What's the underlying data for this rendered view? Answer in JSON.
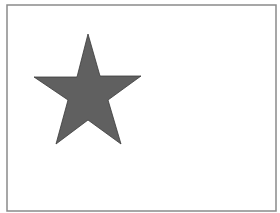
{
  "figure": {
    "type": "shape-diagram",
    "frame": {
      "x": 7,
      "y": 5,
      "width": 269,
      "height": 206,
      "stroke": "#8a8a8a",
      "fill": "#ffffff"
    },
    "shapes": [
      {
        "name": "five-point-star",
        "fill": "#606060",
        "stroke": "#3a3a3a",
        "points": "88,34 100,76 141,76 108,100 121,144 88,120 56,144 68,100 34,77 77,77"
      }
    ]
  }
}
